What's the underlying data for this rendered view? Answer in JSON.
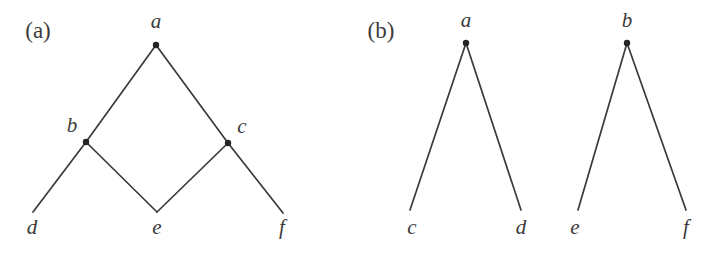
{
  "figure": {
    "background_color": "#ffffff",
    "line_color": "#3a3a3a",
    "label_color": "#3b3b3b",
    "vertex_color": "#242424",
    "width": 714,
    "height": 255
  },
  "panels": [
    {
      "tag": "(a)",
      "tag_x": 38,
      "tag_y": 38,
      "description": "diamond shaped dag with apex a, middle nodes b and c, leaves d, e, f",
      "vertices": [
        {
          "label": "a",
          "x": 156,
          "y": 45,
          "dot": true,
          "label_x": 156,
          "label_y": 28
        },
        {
          "label": "b",
          "x": 86,
          "y": 142,
          "dot": true,
          "label_x": 72,
          "label_y": 132
        },
        {
          "label": "c",
          "x": 228,
          "y": 143,
          "dot": true,
          "label_x": 242,
          "label_y": 133
        },
        {
          "label": "d",
          "x": 33,
          "y": 212,
          "dot": false,
          "label_x": 32,
          "label_y": 234
        },
        {
          "label": "e",
          "x": 157,
          "y": 212,
          "dot": false,
          "label_x": 157,
          "label_y": 234
        },
        {
          "label": "f",
          "x": 283,
          "y": 213,
          "dot": false,
          "label_x": 282,
          "label_y": 234
        }
      ],
      "edges": [
        {
          "from": "a",
          "to": "b",
          "x1": 156,
          "y1": 45,
          "x2": 86,
          "y2": 142
        },
        {
          "from": "a",
          "to": "c",
          "x1": 156,
          "y1": 45,
          "x2": 228,
          "y2": 143
        },
        {
          "from": "b",
          "to": "d",
          "x1": 86,
          "y1": 142,
          "x2": 33,
          "y2": 212
        },
        {
          "from": "b",
          "to": "e",
          "x1": 86,
          "y1": 142,
          "x2": 157,
          "y2": 212
        },
        {
          "from": "c",
          "to": "e",
          "x1": 228,
          "y1": 143,
          "x2": 157,
          "y2": 212
        },
        {
          "from": "c",
          "to": "f",
          "x1": 228,
          "y1": 143,
          "x2": 283,
          "y2": 213
        }
      ]
    },
    {
      "tag": "(b)",
      "tag_x": 381,
      "tag_y": 38,
      "description": "two separate two-leaf trees: a with leaves c and d, b with leaves e and f",
      "vertices": [
        {
          "label": "a",
          "x": 466,
          "y": 43,
          "dot": true,
          "label_x": 466,
          "label_y": 27
        },
        {
          "label": "b",
          "x": 627,
          "y": 43,
          "dot": true,
          "label_x": 627,
          "label_y": 27
        },
        {
          "label": "c",
          "x": 410,
          "y": 210,
          "dot": false,
          "label_x": 412,
          "label_y": 234
        },
        {
          "label": "d",
          "x": 521,
          "y": 210,
          "dot": false,
          "label_x": 521,
          "label_y": 234
        },
        {
          "label": "e",
          "x": 578,
          "y": 210,
          "dot": false,
          "label_x": 575,
          "label_y": 234
        },
        {
          "label": "f",
          "x": 686,
          "y": 210,
          "dot": false,
          "label_x": 686,
          "label_y": 234
        }
      ],
      "edges": [
        {
          "from": "a",
          "to": "c",
          "x1": 466,
          "y1": 43,
          "x2": 410,
          "y2": 210
        },
        {
          "from": "a",
          "to": "d",
          "x1": 466,
          "y1": 43,
          "x2": 521,
          "y2": 210
        },
        {
          "from": "b",
          "to": "e",
          "x1": 627,
          "y1": 43,
          "x2": 578,
          "y2": 210
        },
        {
          "from": "b",
          "to": "f",
          "x1": 627,
          "y1": 43,
          "x2": 686,
          "y2": 210
        }
      ]
    }
  ]
}
